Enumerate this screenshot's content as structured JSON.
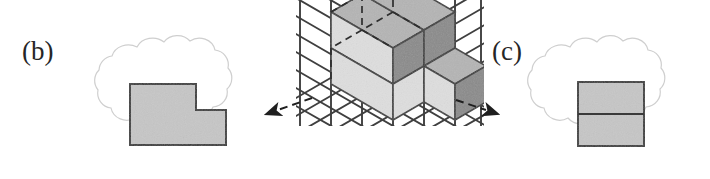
{
  "figure": {
    "type": "textbook-illustration",
    "background_color": "#ffffff"
  },
  "panels": {
    "b": {
      "label": "(b)",
      "caption": "Side view",
      "shape": "L-shaped polygon",
      "fill_color": "#c6c6c6",
      "stroke_color": "#3a3a3a",
      "bubble": "thought-cloud"
    },
    "c": {
      "label": "(c)",
      "caption": "Front view",
      "shape": "square divided by horizontal line",
      "fill_color": "#c6c6c6",
      "stroke_color": "#3a3a3a",
      "bubble": "thought-cloud"
    }
  },
  "center": {
    "name": "isometric-grid",
    "grid_type": "triangular isometric lattice",
    "grid_color": "#3f3f3f",
    "cube_faces": {
      "top_color": "#b4b4b4",
      "left_color": "#dcdcdc",
      "right_color": "#8a8a8a"
    },
    "hidden_edge_style": "dashed",
    "arrows": [
      {
        "name": "arrow-to-side-view",
        "direction": "left",
        "style": "dashed-with-solid-head"
      },
      {
        "name": "arrow-to-front-view",
        "direction": "right",
        "style": "dashed-with-solid-head"
      }
    ]
  },
  "colors": {
    "ink": "#262626",
    "caption_gray": "#8c8c8c",
    "cloud_outline": "#cfcfcf",
    "shape_fill": "#c6c6c6",
    "shape_stroke": "#3a3a3a"
  }
}
